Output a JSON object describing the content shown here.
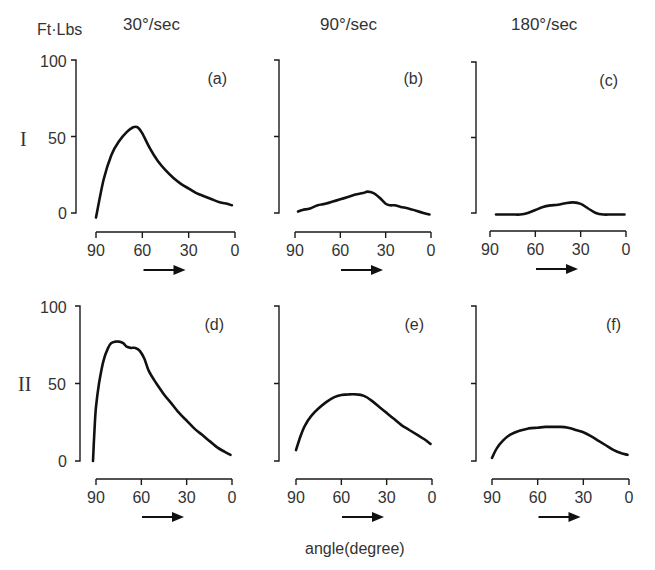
{
  "figure": {
    "y_unit_label": "Ft·Lbs",
    "x_axis_label": "angle(degree)",
    "column_titles": [
      "30°/sec",
      "90°/sec",
      "180°/sec"
    ],
    "row_labels": [
      "I",
      "II"
    ],
    "y_ticks": [
      "100",
      "50",
      "0"
    ],
    "x_ticks": [
      "90",
      "60",
      "30",
      "0"
    ]
  },
  "chart_data": {
    "type": "line",
    "xlabel": "angle(degree)",
    "ylabel": "Ft·Lbs",
    "xlim": [
      90,
      0
    ],
    "ylim": [
      0,
      100
    ],
    "x_ticks": [
      90,
      60,
      30,
      0
    ],
    "y_ticks": [
      0,
      50,
      100
    ],
    "grid": false,
    "direction_arrow": "90 → 0",
    "panels": [
      {
        "id": "a",
        "label": "(a)",
        "row": "I",
        "velocity": "30°/sec",
        "x": [
          90,
          85,
          80,
          75,
          70,
          66,
          63,
          60,
          55,
          50,
          45,
          40,
          35,
          30,
          25,
          20,
          15,
          10,
          5,
          2
        ],
        "y": [
          -3,
          22,
          38,
          47,
          53,
          56,
          56,
          52,
          42,
          34,
          28,
          23,
          19,
          16,
          13,
          11,
          9,
          7,
          6,
          5
        ]
      },
      {
        "id": "b",
        "label": "(b)",
        "row": "I",
        "velocity": "90°/sec",
        "x": [
          88,
          85,
          80,
          75,
          70,
          65,
          60,
          55,
          50,
          45,
          42,
          38,
          34,
          30,
          27,
          24,
          20,
          15,
          10,
          5,
          1
        ],
        "y": [
          1,
          2,
          3,
          5,
          6,
          7.5,
          9,
          10.5,
          12,
          13,
          14,
          13,
          10,
          6,
          5,
          5,
          4,
          3,
          1.5,
          0,
          -1
        ]
      },
      {
        "id": "c",
        "label": "(c)",
        "row": "I",
        "velocity": "180°/sec",
        "x": [
          86,
          80,
          75,
          70,
          65,
          60,
          55,
          50,
          45,
          40,
          35,
          30,
          25,
          20,
          15,
          10,
          5,
          1
        ],
        "y": [
          -1,
          -1,
          -1,
          -1,
          0,
          2,
          4,
          5,
          5.5,
          6.5,
          7,
          6,
          3,
          0,
          -1,
          -1,
          -1,
          -1
        ]
      },
      {
        "id": "d",
        "label": "(d)",
        "row": "II",
        "velocity": "30°/sec",
        "x": [
          92,
          91,
          90,
          88,
          85,
          82,
          80,
          77,
          75,
          72,
          70,
          67,
          64,
          61,
          58,
          55,
          50,
          45,
          40,
          35,
          30,
          25,
          20,
          15,
          10,
          5,
          1
        ],
        "y": [
          0,
          20,
          35,
          50,
          65,
          73,
          76,
          77,
          77,
          76,
          74,
          73,
          73,
          71,
          66,
          58,
          50,
          43,
          37,
          31,
          26,
          21,
          17,
          13,
          9,
          6,
          4
        ]
      },
      {
        "id": "e",
        "label": "(e)",
        "row": "II",
        "velocity": "90°/sec",
        "x": [
          90,
          87,
          84,
          80,
          75,
          70,
          65,
          60,
          55,
          50,
          45,
          40,
          35,
          30,
          25,
          20,
          15,
          10,
          5,
          1
        ],
        "y": [
          7,
          16,
          23,
          29,
          34,
          38,
          41,
          42.5,
          43,
          43,
          42,
          39,
          35,
          31,
          27,
          23,
          20,
          17,
          14,
          11
        ]
      },
      {
        "id": "f",
        "label": "(f)",
        "row": "II",
        "velocity": "180°/sec",
        "x": [
          90,
          87,
          83,
          78,
          72,
          66,
          60,
          55,
          50,
          45,
          40,
          35,
          30,
          25,
          20,
          15,
          10,
          5,
          1
        ],
        "y": [
          2,
          8,
          13,
          17,
          19.5,
          21,
          21.5,
          22,
          22,
          22,
          21.5,
          20,
          18.5,
          16,
          13,
          10,
          7,
          5,
          4
        ]
      }
    ]
  }
}
